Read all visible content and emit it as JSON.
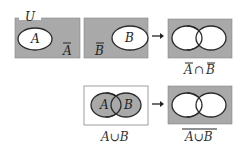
{
  "colors": {
    "shade": "#a9a9a9",
    "stroke": "#2a2a2a",
    "white": "#ffffff"
  },
  "universe_label": "U",
  "panels": [
    {
      "id": "complement-a",
      "inner_label": "A",
      "outside_label": "A",
      "outside_overbar": true
    },
    {
      "id": "complement-b",
      "inner_label": "B",
      "outside_label": "B",
      "outside_overbar": true
    },
    {
      "id": "intersection-of-complements",
      "caption_left": "A",
      "caption_op": "∩",
      "caption_right": "B",
      "caption_overbars": true
    },
    {
      "id": "union",
      "label_a": "A",
      "label_b": "B",
      "caption": "A∪B"
    },
    {
      "id": "complement-of-union",
      "caption": "A∪B",
      "caption_overbar": true
    }
  ],
  "arrows": [
    "→",
    "→"
  ]
}
